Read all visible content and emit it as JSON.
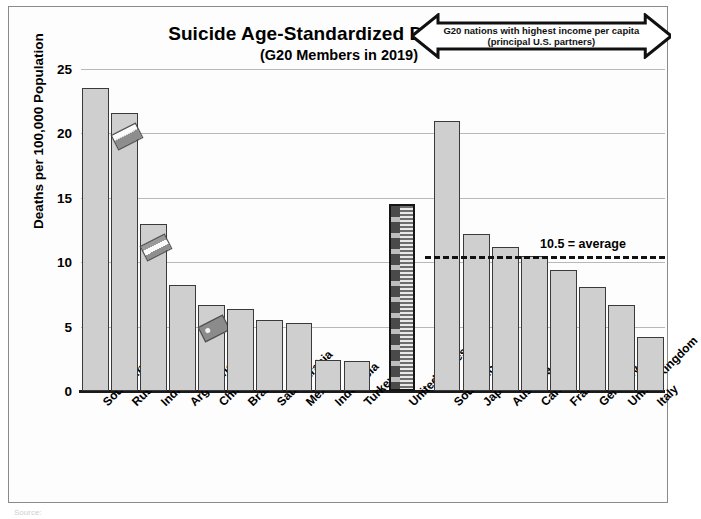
{
  "chart_data": {
    "type": "bar",
    "title": "Suicide Age-Standardized Death Rate",
    "subtitle": "(G20 Members in 2019)",
    "xlabel": "",
    "ylabel": "Deaths per 100,000 Population",
    "ylim": [
      0,
      25
    ],
    "yticks": [
      0,
      5,
      10,
      15,
      20,
      25
    ],
    "grid": true,
    "legend": "none",
    "categories": [
      "South Africa",
      "Russia",
      "India",
      "Argentina",
      "China",
      "Brazil",
      "Saudi Arabia",
      "Mexico",
      "Indonesia",
      "Turkey",
      "United States",
      "South Korea",
      "Japan",
      "Australia",
      "Canada",
      "France",
      "Germany",
      "United Kingdom",
      "Italy"
    ],
    "values": [
      23.5,
      21.6,
      13.0,
      8.2,
      6.7,
      6.4,
      5.5,
      5.3,
      2.4,
      2.3,
      14.5,
      21.0,
      12.2,
      11.2,
      10.5,
      9.4,
      8.1,
      6.7,
      4.2
    ],
    "groups": [
      {
        "name": "other-g20",
        "start": 0,
        "end": 9
      },
      {
        "name": "united-states",
        "start": 10,
        "end": 10
      },
      {
        "name": "high-income-g20",
        "start": 11,
        "end": 18
      }
    ],
    "data_labels": {
      "United States": "14.5"
    },
    "highlight_bar": "United States",
    "flag_markers": [
      "Russia",
      "India",
      "China"
    ],
    "annotations": [
      {
        "name": "average-line",
        "type": "hline",
        "value": 10.5,
        "label": "10.5 = average",
        "style": "dashed"
      },
      {
        "name": "income-arrow",
        "type": "double-arrow",
        "line1": "G20 nations with highest income per capita",
        "line2": "(principal U.S. partners)",
        "spans": [
          "South Korea",
          "Italy"
        ]
      }
    ],
    "colors": {
      "bar_fill": "#cfcfcf",
      "bar_edge": "#3a3a3a",
      "us_bar_edge": "#151515",
      "gridline": "#b9b9b9",
      "axis": "#1a1a1a",
      "text": "#000000",
      "background": "#fdfdfd",
      "frame": "#8a8a8a"
    }
  },
  "axis": {
    "y_tick_labels": [
      "25",
      "20",
      "15",
      "10",
      "5",
      "0"
    ],
    "y_title": "Deaths per 100,000 Population"
  },
  "average": {
    "label": "10.5 = average",
    "value": 10.5
  },
  "arrow_note": {
    "line1": "G20 nations with highest income per capita",
    "line2": "(principal U.S. partners)"
  },
  "us_label": "14.5",
  "source": {
    "text": "Source: "
  }
}
